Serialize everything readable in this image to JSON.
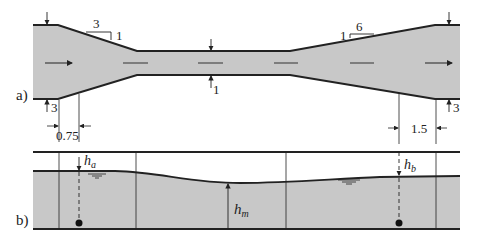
{
  "figure": {
    "panel_a": {
      "label": "a)",
      "slope_left": {
        "run": "3",
        "rise": "1"
      },
      "slope_right": {
        "rise": "1",
        "run": "6"
      },
      "dims": {
        "left_width": "3",
        "narrow_width": "1",
        "right_width": "3",
        "left_offset": "0.75",
        "right_offset": "1.5"
      }
    },
    "panel_b": {
      "label": "b)",
      "h_a": "h",
      "h_a_sub": "a",
      "h_m": "h",
      "h_m_sub": "m",
      "h_b": "h",
      "h_b_sub": "b"
    },
    "colors": {
      "fill": "#c8c8c8",
      "line": "#222222"
    }
  }
}
